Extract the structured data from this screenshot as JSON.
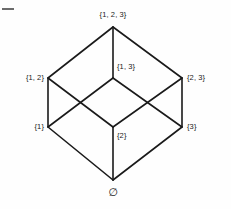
{
  "figure": {
    "background_color": "#fefefe",
    "line_color": "#1a1a1a",
    "text_color": "#1a1a1a",
    "corner_mark_color": "#6b6b6b",
    "width": 231,
    "height": 209
  },
  "chart_data": {
    "type": "diagram",
    "diagram_kind": "hasse-lattice",
    "nodes": [
      {
        "id": "full",
        "label": "{1, 2, 3}",
        "rank": 3,
        "x": 113,
        "y": 27,
        "label_x": 113,
        "label_y": 15,
        "anchor": "center"
      },
      {
        "id": "s12",
        "label": "{1, 2}",
        "rank": 2,
        "x": 48,
        "y": 78,
        "label_x": 44,
        "label_y": 78,
        "anchor": "right"
      },
      {
        "id": "s13",
        "label": "{1, 3}",
        "rank": 2,
        "x": 113,
        "y": 78,
        "label_x": 117,
        "label_y": 67,
        "anchor": "left"
      },
      {
        "id": "s23",
        "label": "{2, 3}",
        "rank": 2,
        "x": 182,
        "y": 78,
        "label_x": 187,
        "label_y": 78,
        "anchor": "left"
      },
      {
        "id": "s1",
        "label": "{1}",
        "rank": 1,
        "x": 48,
        "y": 127,
        "label_x": 44,
        "label_y": 127,
        "anchor": "right"
      },
      {
        "id": "s2",
        "label": "{2}",
        "rank": 1,
        "x": 113,
        "y": 127,
        "label_x": 117,
        "label_y": 136,
        "anchor": "left"
      },
      {
        "id": "s3",
        "label": "{3}",
        "rank": 1,
        "x": 182,
        "y": 127,
        "label_x": 187,
        "label_y": 127,
        "anchor": "left"
      },
      {
        "id": "empty",
        "label": "∅",
        "rank": 0,
        "x": 113,
        "y": 180,
        "label_x": 113,
        "label_y": 192,
        "anchor": "center"
      }
    ],
    "edges": [
      {
        "from": "full",
        "to": "s12"
      },
      {
        "from": "full",
        "to": "s13"
      },
      {
        "from": "full",
        "to": "s23"
      },
      {
        "from": "s12",
        "to": "s1"
      },
      {
        "from": "s12",
        "to": "s2"
      },
      {
        "from": "s13",
        "to": "s1"
      },
      {
        "from": "s13",
        "to": "s3"
      },
      {
        "from": "s23",
        "to": "s2"
      },
      {
        "from": "s23",
        "to": "s3"
      },
      {
        "from": "s1",
        "to": "empty"
      },
      {
        "from": "s2",
        "to": "empty"
      },
      {
        "from": "s3",
        "to": "empty"
      }
    ]
  }
}
